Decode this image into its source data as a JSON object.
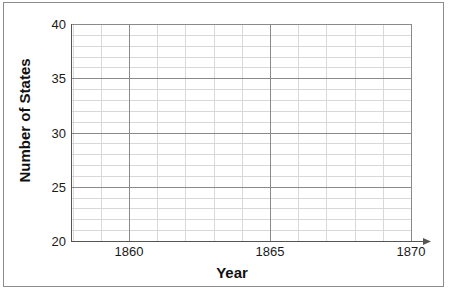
{
  "chart_data": {
    "type": "line",
    "title": "",
    "subtitle": "",
    "xlabel": "Year",
    "ylabel": "Number of States",
    "xlim": [
      1857.8,
      1871.0
    ],
    "ylim": [
      20,
      40
    ],
    "xticks": [
      1860,
      1865,
      1870
    ],
    "xtick_labels": [
      "1860",
      "1865",
      "1870"
    ],
    "yticks": [
      20,
      25,
      30,
      35,
      40
    ],
    "ytick_labels": [
      "20",
      "25",
      "30",
      "35",
      "40"
    ],
    "x_minor_step": 1,
    "y_minor_step": 1,
    "grid": true,
    "grid_major_color": "#8a8a8a",
    "grid_minor_color": "#d8d8d8",
    "axis_color": "#555555",
    "legend": null,
    "legend_position": "none",
    "series": [],
    "x": [],
    "values": [],
    "annotations": [],
    "note": "Empty coordinate grid with no plotted data points."
  },
  "axes": {
    "y_title": "Number of States",
    "x_title": "Year",
    "y_ticks": [
      {
        "label": "40",
        "value": 40
      },
      {
        "label": "35",
        "value": 35
      },
      {
        "label": "30",
        "value": 30
      },
      {
        "label": "25",
        "value": 25
      },
      {
        "label": "20",
        "value": 20
      }
    ],
    "x_ticks": [
      {
        "label": "1860",
        "value": 1860
      },
      {
        "label": "1865",
        "value": 1865
      },
      {
        "label": "1870",
        "value": 1870
      }
    ]
  },
  "colors": {
    "page_background": "#ffffff",
    "frame": "#8c8c8c",
    "axis": "#555555",
    "major_grid": "#8a8a8a",
    "minor_grid": "#d8d8d8",
    "text": "#1a1a1a"
  }
}
